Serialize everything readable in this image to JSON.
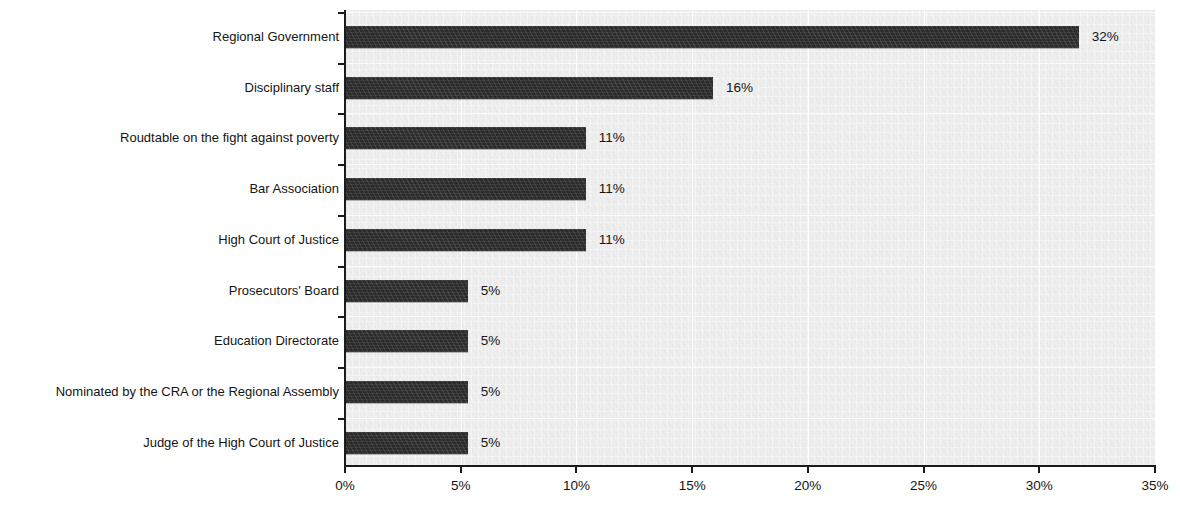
{
  "chart_data": {
    "type": "bar",
    "orientation": "horizontal",
    "title": "",
    "subtitle": "",
    "xlabel": "",
    "ylabel": "",
    "xlim": [
      0,
      35
    ],
    "ylim": null,
    "grid": true,
    "legend": null,
    "legend_position": "none",
    "unit": "%",
    "bar_color": "#2b2b2b",
    "plot_background": "#ededed",
    "axis_color": "#1b1b1b",
    "categories": [
      "Regional Government",
      "Disciplinary staff",
      "Roudtable on the fight against poverty",
      "Bar Association",
      "High Court of Justice",
      "Prosecutors' Board",
      "Education Directorate",
      "Nominated by the CRA or the Regional Assembly",
      "Judge of the High Court of Justice"
    ],
    "values": [
      32,
      16,
      11,
      11,
      11,
      5,
      5,
      5,
      5
    ],
    "data_labels": [
      "32%",
      "16%",
      "11%",
      "11%",
      "11%",
      "5%",
      "5%",
      "5%",
      "5%"
    ],
    "bar_extents_pct": [
      31.7,
      15.9,
      10.4,
      10.4,
      10.4,
      5.3,
      5.3,
      5.3,
      5.3
    ],
    "xticks": [
      0,
      5,
      10,
      15,
      20,
      25,
      30,
      35
    ],
    "xtick_labels": [
      "0%",
      "5%",
      "10%",
      "15%",
      "20%",
      "25%",
      "30%",
      "35%"
    ]
  }
}
